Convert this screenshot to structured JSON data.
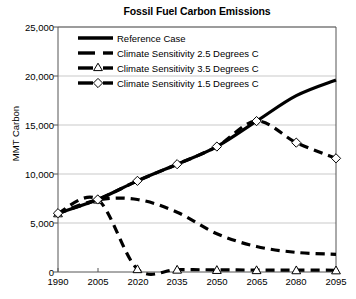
{
  "chart_data": {
    "type": "line",
    "title": "Fossil Fuel Carbon Emissions",
    "xlabel": "",
    "ylabel": "MMT Carbon",
    "x": [
      1990,
      2005,
      2020,
      2035,
      2050,
      2065,
      2080,
      2095
    ],
    "xticklabels": [
      "1990",
      "2005",
      "2020",
      "2035",
      "2050",
      "2065",
      "2080",
      "2095"
    ],
    "yticklabels": [
      "0",
      "5,000",
      "10,000",
      "15,000",
      "20,000",
      "25,000"
    ],
    "yticks": [
      0,
      5000,
      10000,
      15000,
      20000,
      25000
    ],
    "xlim": [
      1990,
      2095
    ],
    "ylim": [
      0,
      25000
    ],
    "grid": "horizontal",
    "legend_position": "upper-left-inside",
    "series": [
      {
        "name": "Reference Case",
        "style": "solid",
        "marker": "none",
        "color": "#000000",
        "values": [
          6000,
          7400,
          9300,
          11000,
          12800,
          15400,
          18000,
          19600
        ]
      },
      {
        "name": "Climate Sensitivity 2.5 Degrees C",
        "style": "dashed",
        "marker": "none",
        "color": "#000000",
        "values": [
          6000,
          7350,
          7400,
          6100,
          3900,
          2600,
          2000,
          1800
        ]
      },
      {
        "name": "Climate Sensitivity 3.5 Degrees C",
        "style": "dashed",
        "marker": "triangle",
        "color": "#000000",
        "values": [
          6000,
          7400,
          300,
          250,
          220,
          200,
          190,
          180
        ]
      },
      {
        "name": "Climate Sensitivity 1.5 Degrees C",
        "style": "dashed",
        "marker": "diamond",
        "color": "#000000",
        "values": [
          6000,
          7400,
          9300,
          11000,
          12800,
          15400,
          13200,
          11600
        ]
      }
    ]
  },
  "legend": {
    "items": [
      {
        "label": "Reference Case"
      },
      {
        "label": "Climate Sensitivity 2.5 Degrees C"
      },
      {
        "label": "Climate Sensitivity 3.5 Degrees C"
      },
      {
        "label": "Climate Sensitivity 1.5 Degrees C"
      }
    ]
  },
  "colors": {
    "ink": "#000000",
    "grid": "#c9c9c9",
    "axis": "#555555",
    "background": "#ffffff"
  }
}
